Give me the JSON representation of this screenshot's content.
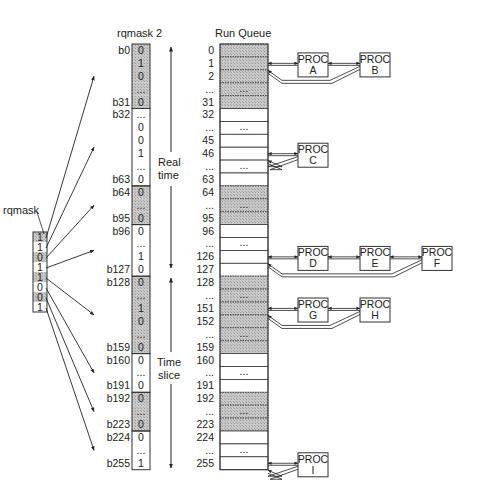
{
  "titles": {
    "rqmask": "rqmask",
    "rqmask2": "rqmask 2",
    "run_queue": "Run Queue"
  },
  "rqmask": {
    "cells": [
      {
        "value": "1",
        "shaded": true
      },
      {
        "value": "1",
        "shaded": false
      },
      {
        "value": "0",
        "shaded": true
      },
      {
        "value": "1",
        "shaded": false
      },
      {
        "value": "1",
        "shaded": true
      },
      {
        "value": "0",
        "shaded": false
      },
      {
        "value": "0",
        "shaded": true
      },
      {
        "value": "1",
        "shaded": false
      }
    ]
  },
  "rqmask2": {
    "rows": [
      {
        "label": "b0",
        "value": "0",
        "shaded": true
      },
      {
        "label": "",
        "value": "1",
        "shaded": true
      },
      {
        "label": "",
        "value": "0",
        "shaded": true
      },
      {
        "label": "",
        "value": "...",
        "shaded": true
      },
      {
        "label": "b31",
        "value": "0",
        "shaded": true
      },
      {
        "label": "b32",
        "value": "...",
        "shaded": false
      },
      {
        "label": "",
        "value": "0",
        "shaded": false
      },
      {
        "label": "",
        "value": "0",
        "shaded": false
      },
      {
        "label": "",
        "value": "1",
        "shaded": false
      },
      {
        "label": "",
        "value": "...",
        "shaded": false
      },
      {
        "label": "b63",
        "value": "0",
        "shaded": false
      },
      {
        "label": "b64",
        "value": "0",
        "shaded": true
      },
      {
        "label": "",
        "value": "...",
        "shaded": true
      },
      {
        "label": "b95",
        "value": "0",
        "shaded": true
      },
      {
        "label": "b96",
        "value": "0",
        "shaded": false
      },
      {
        "label": "",
        "value": "...",
        "shaded": false
      },
      {
        "label": "",
        "value": "1",
        "shaded": false
      },
      {
        "label": "b127",
        "value": "0",
        "shaded": false
      },
      {
        "label": "b128",
        "value": "0",
        "shaded": true
      },
      {
        "label": "",
        "value": "...",
        "shaded": true
      },
      {
        "label": "",
        "value": "1",
        "shaded": true
      },
      {
        "label": "",
        "value": "0",
        "shaded": true
      },
      {
        "label": "",
        "value": "...",
        "shaded": true
      },
      {
        "label": "b159",
        "value": "0",
        "shaded": true
      },
      {
        "label": "b160",
        "value": "0",
        "shaded": false
      },
      {
        "label": "",
        "value": "...",
        "shaded": false
      },
      {
        "label": "b191",
        "value": "0",
        "shaded": false
      },
      {
        "label": "b192",
        "value": "0",
        "shaded": true
      },
      {
        "label": "",
        "value": "...",
        "shaded": true
      },
      {
        "label": "b223",
        "value": "0",
        "shaded": true
      },
      {
        "label": "b224",
        "value": "0",
        "shaded": false
      },
      {
        "label": "",
        "value": "...",
        "shaded": false
      },
      {
        "label": "b255",
        "value": "1",
        "shaded": false
      }
    ]
  },
  "bands": [
    {
      "label_line1": "Real",
      "label_line2": "time"
    },
    {
      "label_line1": "Time",
      "label_line2": "slice"
    }
  ],
  "run_queue": {
    "rows": [
      {
        "index": "0",
        "shaded": true,
        "dots": false
      },
      {
        "index": "1",
        "shaded": true,
        "dots": false
      },
      {
        "index": "2",
        "shaded": true,
        "dots": false
      },
      {
        "index": "...",
        "shaded": true,
        "dots": true
      },
      {
        "index": "31",
        "shaded": true,
        "dots": false
      },
      {
        "index": "32",
        "shaded": false,
        "dots": false
      },
      {
        "index": "...",
        "shaded": false,
        "dots": true
      },
      {
        "index": "45",
        "shaded": false,
        "dots": false
      },
      {
        "index": "46",
        "shaded": false,
        "dots": false
      },
      {
        "index": "...",
        "shaded": false,
        "dots": true
      },
      {
        "index": "63",
        "shaded": false,
        "dots": false
      },
      {
        "index": "64",
        "shaded": true,
        "dots": false
      },
      {
        "index": "...",
        "shaded": true,
        "dots": true
      },
      {
        "index": "95",
        "shaded": true,
        "dots": false
      },
      {
        "index": "96",
        "shaded": false,
        "dots": false
      },
      {
        "index": "...",
        "shaded": false,
        "dots": true
      },
      {
        "index": "126",
        "shaded": false,
        "dots": false
      },
      {
        "index": "127",
        "shaded": false,
        "dots": false
      },
      {
        "index": "128",
        "shaded": true,
        "dots": false
      },
      {
        "index": "...",
        "shaded": true,
        "dots": true
      },
      {
        "index": "151",
        "shaded": true,
        "dots": false
      },
      {
        "index": "152",
        "shaded": true,
        "dots": false
      },
      {
        "index": "...",
        "shaded": true,
        "dots": true
      },
      {
        "index": "159",
        "shaded": true,
        "dots": false
      },
      {
        "index": "160",
        "shaded": false,
        "dots": false
      },
      {
        "index": "...",
        "shaded": false,
        "dots": true
      },
      {
        "index": "191",
        "shaded": false,
        "dots": false
      },
      {
        "index": "192",
        "shaded": true,
        "dots": false
      },
      {
        "index": "...",
        "shaded": true,
        "dots": true
      },
      {
        "index": "223",
        "shaded": true,
        "dots": false
      },
      {
        "index": "224",
        "shaded": false,
        "dots": false
      },
      {
        "index": "...",
        "shaded": false,
        "dots": true
      },
      {
        "index": "255",
        "shaded": false,
        "dots": false
      }
    ]
  },
  "procs": [
    {
      "line1": "PROC",
      "line2": "A",
      "queue_index": "1"
    },
    {
      "line1": "PROC",
      "line2": "B",
      "queue_index": "1"
    },
    {
      "line1": "PROC",
      "line2": "C",
      "queue_index": "46"
    },
    {
      "line1": "PROC",
      "line2": "D",
      "queue_index": "126"
    },
    {
      "line1": "PROC",
      "line2": "E",
      "queue_index": "126"
    },
    {
      "line1": "PROC",
      "line2": "F",
      "queue_index": "126"
    },
    {
      "line1": "PROC",
      "line2": "G",
      "queue_index": "151"
    },
    {
      "line1": "PROC",
      "line2": "H",
      "queue_index": "151"
    },
    {
      "line1": "PROC",
      "line2": "I",
      "queue_index": "255"
    }
  ],
  "colors": {
    "shade": "#b8b8b8",
    "line": "#333333"
  }
}
